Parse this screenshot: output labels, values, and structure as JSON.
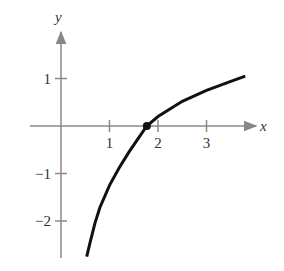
{
  "chart_data": {
    "type": "line",
    "title": "",
    "xlabel": "x",
    "ylabel": "y",
    "xlim": [
      -0.65,
      4.2
    ],
    "ylim": [
      -2.75,
      1.6
    ],
    "x_ticks": [
      "1",
      "2",
      "3"
    ],
    "y_ticks": [
      "1",
      "−1",
      "−2"
    ],
    "grid": false,
    "legend": [],
    "series": [
      {
        "name": "curve",
        "x": [
          0.53,
          0.6,
          0.7,
          0.8,
          1.0,
          1.2,
          1.4,
          1.6,
          1.77,
          2.0,
          2.5,
          3.0,
          3.5,
          3.8
        ],
        "y": [
          -2.75,
          -2.45,
          -2.05,
          -1.72,
          -1.25,
          -0.88,
          -0.55,
          -0.25,
          0.0,
          0.2,
          0.52,
          0.75,
          0.94,
          1.05
        ]
      }
    ],
    "annotations": [
      {
        "type": "point",
        "x": 1.77,
        "y": 0,
        "label": ""
      }
    ]
  },
  "axes": {
    "x_label": "x",
    "y_label": "y",
    "x_tick_labels": [
      "1",
      "2",
      "3"
    ],
    "y_tick_labels": [
      "1",
      "−1",
      "−2"
    ]
  }
}
